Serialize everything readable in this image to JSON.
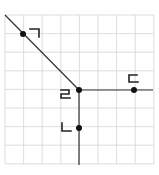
{
  "diagram": {
    "grid": {
      "cols": 8,
      "rows": 8,
      "x0": 5,
      "y0": 15,
      "cell": 18.6
    },
    "vertex": {
      "label": "ㄹ",
      "x": 79,
      "y": 90
    },
    "points": [
      {
        "label": "ㄱ",
        "x": 23,
        "y": 34
      },
      {
        "label": "ㄷ",
        "x": 134,
        "y": 90
      },
      {
        "label": "ㄴ",
        "x": 79,
        "y": 128
      }
    ],
    "rays": [
      {
        "name": "ray-to-giyeok",
        "from": [
          79,
          90
        ],
        "to": [
          5,
          15
        ]
      },
      {
        "name": "ray-to-digeut",
        "from": [
          79,
          90
        ],
        "to": [
          153,
          90
        ]
      },
      {
        "name": "ray-to-nieun",
        "from": [
          79,
          90
        ],
        "to": [
          79,
          165
        ]
      }
    ],
    "colors": {
      "grid": "#d4d4d4",
      "line": "#333333",
      "point": "#111111"
    }
  }
}
